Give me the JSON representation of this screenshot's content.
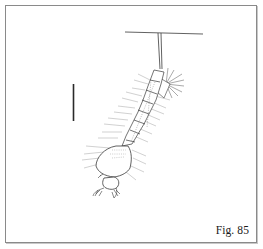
{
  "figure": {
    "caption": "Fig. 85",
    "colors": {
      "ink": "#2a2a2a",
      "hair": "#6a6a6a",
      "border": "#8a8a8a",
      "background": "#ffffff"
    },
    "scale_bar": {
      "visible": true
    }
  }
}
